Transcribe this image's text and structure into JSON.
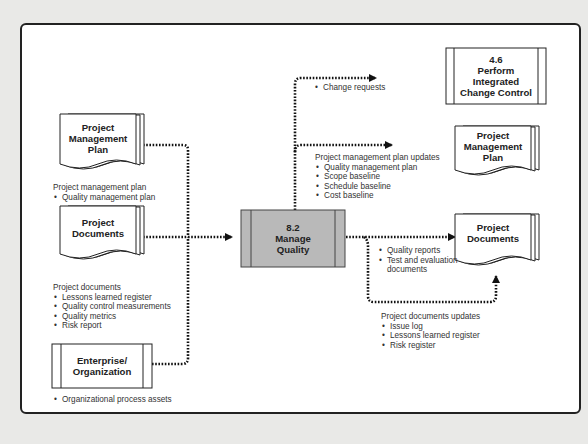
{
  "diagram": {
    "inputs": [
      {
        "title": "Project Management Plan",
        "lines": [
          "Project",
          "Management",
          "Plan"
        ],
        "label_heading": "Project management plan",
        "label_items": [
          "Quality management plan"
        ]
      },
      {
        "title": "Project Documents",
        "lines": [
          "Project",
          "Documents"
        ],
        "label_heading": "Project documents",
        "label_items": [
          "Lessons learned register",
          "Quality control measurements",
          "Quality metrics",
          "Risk report"
        ]
      },
      {
        "title": "Enterprise/ Organization",
        "lines": [
          "Enterprise/",
          "Organization"
        ],
        "label_heading": "",
        "label_items": [
          "Organizational process assets"
        ]
      }
    ],
    "process": {
      "number": "8.2",
      "line1": "Manage",
      "line2": "Quality",
      "fill": "#b9b9b9"
    },
    "outputs": [
      {
        "title": "4.6 Perform Integrated Change Control",
        "lines": [
          "4.6",
          "Perform",
          "Integrated",
          "Change Control"
        ],
        "label_heading": "",
        "label_items": [
          "Change requests"
        ]
      },
      {
        "title": "Project Management Plan",
        "lines": [
          "Project",
          "Management",
          "Plan"
        ],
        "label_heading": "Project management plan updates",
        "label_items": [
          "Quality management plan",
          "Scope baseline",
          "Schedule baseline",
          "Cost baseline"
        ]
      },
      {
        "title": "Project Documents",
        "lines": [
          "Project",
          "Documents"
        ],
        "label_heading": "",
        "label_items": [
          "Quality reports",
          "Test and evaluation",
          "documents"
        ]
      },
      {
        "title": "Project Documents (updates)",
        "label_heading": "Project documents updates",
        "label_items": [
          "Issue log",
          "Lessons learned register",
          "Risk register"
        ]
      }
    ]
  }
}
